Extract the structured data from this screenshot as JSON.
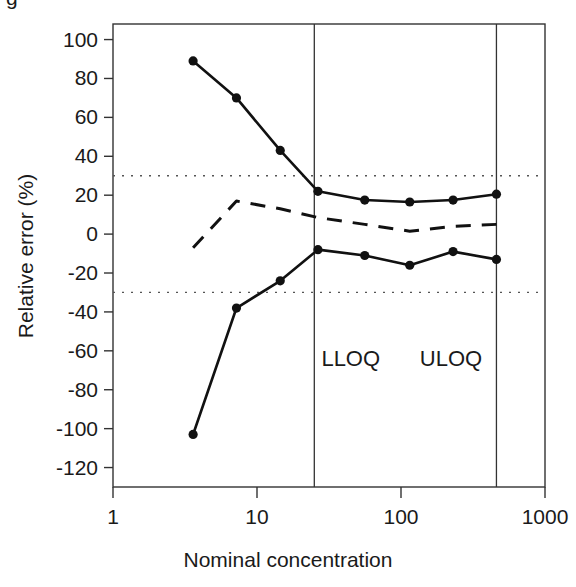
{
  "figure": {
    "background": "#ffffff",
    "line_color": "#111111",
    "dotted_color": "#555555"
  },
  "chart_data": {
    "type": "line",
    "title": "",
    "xlabel": "Nominal concentration",
    "ylabel": "Relative error (%)",
    "xscale": "log",
    "xlim": [
      1,
      1000
    ],
    "ylim": [
      -130,
      108
    ],
    "xticks": [
      1,
      10,
      100,
      1000
    ],
    "xticklabels": [
      "1",
      "10",
      "100",
      "1000"
    ],
    "yticks": [
      100,
      80,
      60,
      40,
      20,
      0,
      -20,
      -40,
      -60,
      -80,
      -100,
      -120
    ],
    "yticklabels": [
      "100",
      "80",
      "60",
      "40",
      "20",
      "0",
      "-20",
      "-40",
      "-60",
      "-80",
      "-100",
      "-120"
    ],
    "grid": false,
    "legend": false,
    "series": [
      {
        "name": "upper-limit",
        "style": "solid",
        "markers": true,
        "x": [
          3.6,
          7.2,
          14.5,
          26.5,
          56,
          115,
          230,
          460
        ],
        "y": [
          89,
          70,
          43,
          22,
          17.5,
          16.5,
          17.5,
          20.5
        ]
      },
      {
        "name": "mean-bias",
        "style": "dashed",
        "markers": false,
        "x": [
          3.6,
          7.2,
          14.5,
          26.5,
          56,
          115,
          230,
          460
        ],
        "y": [
          -7,
          17,
          13,
          8.5,
          5,
          1.5,
          4,
          5
        ]
      },
      {
        "name": "lower-limit",
        "style": "solid",
        "markers": true,
        "x": [
          3.6,
          7.2,
          14.5,
          26.5,
          56,
          115,
          230,
          460
        ],
        "y": [
          -103,
          -38,
          -24,
          -8,
          -11,
          -16,
          -9,
          -13
        ]
      }
    ],
    "reference_lines": [
      {
        "name": "upper-acceptance-limit",
        "orientation": "horizontal",
        "value": 30,
        "style": "dotted"
      },
      {
        "name": "lower-acceptance-limit",
        "orientation": "horizontal",
        "value": -30,
        "style": "dotted"
      },
      {
        "name": "lloq-line",
        "orientation": "vertical",
        "value": 25,
        "style": "solid"
      },
      {
        "name": "uloq-line",
        "orientation": "vertical",
        "value": 460,
        "style": "solid"
      }
    ],
    "annotations": [
      {
        "name": "lloq-label",
        "text": "LLOQ",
        "x": 28,
        "y": -68
      },
      {
        "name": "uloq-label",
        "text": "ULOQ",
        "x": 135,
        "y": -68
      }
    ]
  },
  "clipped_header": "g"
}
